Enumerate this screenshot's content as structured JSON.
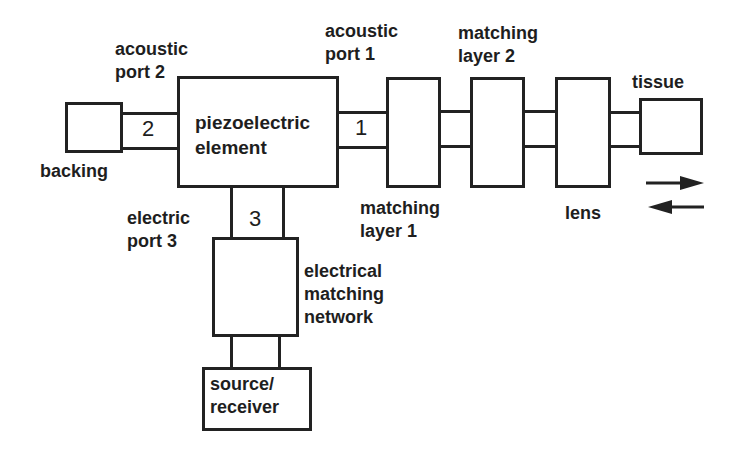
{
  "diagram": {
    "nodes": [
      {
        "id": "backing",
        "label": "backing"
      },
      {
        "id": "piezo",
        "label": "piezoelectric\nelement"
      },
      {
        "id": "matching1",
        "label": "matching\nlayer 1"
      },
      {
        "id": "matching2",
        "label": "matching\nlayer 2"
      },
      {
        "id": "lens",
        "label": "lens"
      },
      {
        "id": "tissue",
        "label": "tissue"
      },
      {
        "id": "emn",
        "label": "electrical\nmatching\nnetwork"
      },
      {
        "id": "source",
        "label": "source/\nreceiver"
      }
    ],
    "ports": [
      {
        "number": "1",
        "label": "acoustic\nport 1"
      },
      {
        "number": "2",
        "label": "acoustic\nport 2"
      },
      {
        "number": "3",
        "label": "electric\nport 3"
      }
    ],
    "edges": [
      {
        "from": "backing",
        "to": "piezo",
        "port": "2"
      },
      {
        "from": "piezo",
        "to": "matching1",
        "port": "1"
      },
      {
        "from": "matching1",
        "to": "matching2"
      },
      {
        "from": "matching2",
        "to": "lens"
      },
      {
        "from": "lens",
        "to": "tissue"
      },
      {
        "from": "piezo",
        "to": "emn",
        "port": "3"
      },
      {
        "from": "emn",
        "to": "source"
      }
    ],
    "direction_arrows": [
      "right",
      "left"
    ]
  },
  "labels": {
    "acoustic_port_2": "acoustic\nport 2",
    "acoustic_port_1": "acoustic\nport 1",
    "electric_port_3": "electric\nport 3",
    "backing": "backing",
    "piezo": "piezoelectric\nelement",
    "matching_layer_1": "matching\nlayer 1",
    "matching_layer_2": "matching\nlayer 2",
    "lens": "lens",
    "tissue": "tissue",
    "emn": "electrical\nmatching\nnetwork",
    "source": "source/\nreceiver",
    "port1_num": "1",
    "port2_num": "2",
    "port3_num": "3"
  }
}
